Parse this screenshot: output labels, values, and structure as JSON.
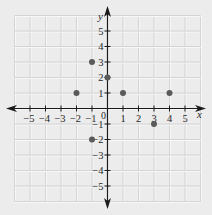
{
  "chart_data": {
    "type": "scatter",
    "title": "",
    "xlabel": "x",
    "ylabel": "y",
    "xlim": [
      -6,
      6
    ],
    "ylim": [
      -6,
      6
    ],
    "grid": true,
    "x_ticks": [
      -5,
      -4,
      -3,
      -2,
      -1,
      1,
      2,
      3,
      4,
      5
    ],
    "y_ticks": [
      -5,
      -4,
      -3,
      -2,
      -1,
      1,
      2,
      3,
      4,
      5
    ],
    "origin_label": "0",
    "points": [
      {
        "x": -2,
        "y": 1
      },
      {
        "x": -1,
        "y": 3
      },
      {
        "x": 0,
        "y": 2
      },
      {
        "x": 1,
        "y": 1
      },
      {
        "x": 4,
        "y": 1
      },
      {
        "x": 3,
        "y": -1
      },
      {
        "x": -1,
        "y": -2
      }
    ]
  },
  "colors": {
    "background": "#ececec",
    "grid": "#d4d4d4",
    "grid_highlight": "#f7f7f7",
    "axis": "#1a1a1a",
    "point": "#5a5a5a",
    "text": "#2a2a2a"
  }
}
